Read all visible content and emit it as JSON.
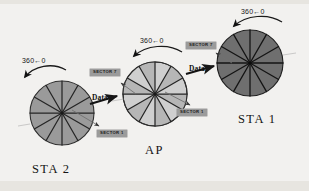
{
  "figure": {
    "background_color": "#f2f1ef",
    "line_color": "#2b2b2b"
  },
  "nodes": [
    {
      "id": "sta2",
      "caption": "STA 2",
      "role": "station",
      "cx": 62,
      "cy": 113,
      "r": 32,
      "sectors": 12,
      "fill": "#9a9a9a",
      "alternate_fill": "#9a9a9a",
      "stroke": "#2e2e2e",
      "caption_x": 32,
      "caption_y": 162,
      "rotation_label": "360←0",
      "rotation_label_x": 22,
      "rotation_label_y": 57
    },
    {
      "id": "ap",
      "caption": "AP",
      "role": "access-point",
      "cx": 155,
      "cy": 94,
      "r": 32,
      "sectors": 12,
      "fill": "#cfcfcf",
      "alternate_fill": "#b6b6b6",
      "stroke": "#2e2e2e",
      "caption_x": 145,
      "caption_y": 143,
      "rotation_label": "360←0",
      "rotation_label_x": 140,
      "rotation_label_y": 37
    },
    {
      "id": "sta1",
      "caption": "STA 1",
      "role": "station",
      "cx": 250,
      "cy": 63,
      "r": 33,
      "sectors": 12,
      "fill": "#6f6f6f",
      "alternate_fill": "#6f6f6f",
      "stroke": "#1f1f1f",
      "caption_x": 238,
      "caption_y": 112,
      "rotation_label": "360←0",
      "rotation_label_x": 241,
      "rotation_label_y": 8
    }
  ],
  "sector_badges": [
    {
      "id": "sta2-sector1",
      "label": "SECTOR 1",
      "x": 97,
      "y": 130
    },
    {
      "id": "ap-sector7",
      "label": "SECTOR 7",
      "x": 90,
      "y": 69
    },
    {
      "id": "ap-sector1",
      "label": "SECTOR 1",
      "x": 177,
      "y": 109
    },
    {
      "id": "sta1-sector7",
      "label": "SECTOR 7",
      "x": 186,
      "y": 42
    }
  ],
  "data_labels": [
    {
      "id": "data-sta2-ap",
      "label": "Data",
      "x": 92,
      "y": 93
    },
    {
      "id": "data-ap-sta1",
      "label": "Data",
      "x": 189,
      "y": 64
    }
  ]
}
